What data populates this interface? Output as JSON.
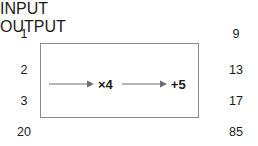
{
  "diagram": {
    "type": "function-machine",
    "columns": {
      "input": {
        "header": "INPUT",
        "values": [
          "1",
          "2",
          "3",
          "20"
        ]
      },
      "output": {
        "header": "OUTPUT",
        "values": [
          "9",
          "13",
          "17",
          "85"
        ]
      }
    },
    "machine": {
      "operations": [
        {
          "label": "×4",
          "arrow": "right-arrow-icon"
        },
        {
          "label": "+5",
          "arrow": "right-arrow-icon"
        }
      ]
    },
    "colors": {
      "text": "#1a1a1a",
      "box_border": "#8a8a8a",
      "arrow": "#6e6e6e",
      "background": "#ffffff"
    }
  }
}
